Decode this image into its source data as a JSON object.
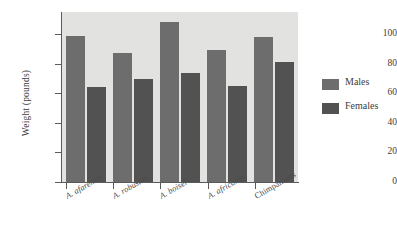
{
  "chart_data": {
    "type": "bar",
    "title": "",
    "xlabel": "",
    "ylabel": "Weight (pounds)",
    "ylim": [
      0,
      115
    ],
    "yticks": [
      0,
      20,
      40,
      60,
      80,
      100
    ],
    "ytick_labels": [
      "0",
      "20",
      "40",
      "60",
      "80",
      "100"
    ],
    "grid": false,
    "legend_position": "right",
    "categories": [
      "A. afarensis",
      "A. robustus",
      "A. boisei",
      "A. africanus",
      "Chimpanzees"
    ],
    "category_styles": [
      "italic",
      "italic",
      "italic",
      "italic",
      "normal"
    ],
    "series": [
      {
        "name": "Males",
        "color": "#6d6d6d",
        "values": [
          99,
          87,
          108,
          89,
          98
        ]
      },
      {
        "name": "Females",
        "color": "#525252",
        "values": [
          64,
          70,
          74,
          65,
          81
        ]
      }
    ]
  },
  "legend": {
    "items": [
      {
        "label": "Males",
        "swatch": "male-swatch"
      },
      {
        "label": "Females",
        "swatch": "female-swatch"
      }
    ]
  },
  "plot_background_color": "#e2e2e0",
  "axis_color": "#5a5a5a"
}
